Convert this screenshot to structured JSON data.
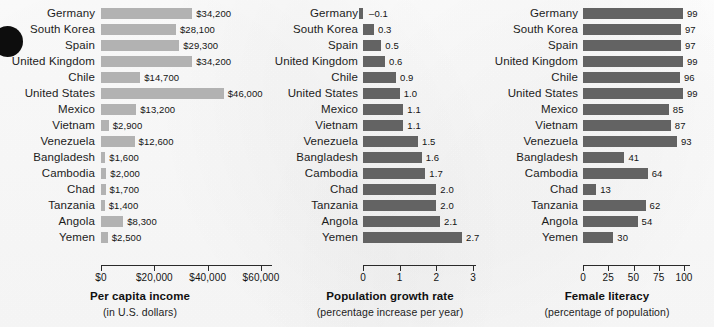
{
  "figure": {
    "categories": [
      "Germany",
      "South Korea",
      "Spain",
      "United Kingdom",
      "Chile",
      "United States",
      "Mexico",
      "Vietnam",
      "Venezuela",
      "Bangladesh",
      "Cambodia",
      "Chad",
      "Tanzania",
      "Angola",
      "Yemen"
    ],
    "bar_color_light": "#b2b2b2",
    "bar_color_dark": "#636363",
    "axis_color": "#2a2a2a"
  },
  "chart_data": [
    {
      "type": "bar",
      "orientation": "horizontal",
      "title": "Per capita income",
      "subtitle": "(in U.S. dollars)",
      "xlabel": "",
      "ylabel": "",
      "xlim": [
        0,
        60000
      ],
      "grid": false,
      "legend": "none",
      "bar_color": "#b2b2b2",
      "tick_values": [
        0,
        20000,
        40000,
        60000
      ],
      "tick_labels": [
        "$0",
        "$20,000",
        "$40,000",
        "$60,000"
      ],
      "categories": [
        "Germany",
        "South Korea",
        "Spain",
        "United Kingdom",
        "Chile",
        "United States",
        "Mexico",
        "Vietnam",
        "Venezuela",
        "Bangladesh",
        "Cambodia",
        "Chad",
        "Tanzania",
        "Angola",
        "Yemen"
      ],
      "values": [
        34200,
        28100,
        29300,
        34200,
        14700,
        46000,
        13200,
        2900,
        12600,
        1600,
        2000,
        1700,
        1400,
        8300,
        2500
      ],
      "value_labels": [
        "$34,200",
        "$28,100",
        "$29,300",
        "$34,200",
        "$14,700",
        "$46,000",
        "$13,200",
        "$2,900",
        "$12,600",
        "$1,600",
        "$2,000",
        "$1,700",
        "$1,400",
        "$8,300",
        "$2,500"
      ]
    },
    {
      "type": "bar",
      "orientation": "horizontal",
      "title": "Population growth rate",
      "subtitle": "(percentage increase per year)",
      "xlabel": "",
      "ylabel": "",
      "xlim": [
        0,
        3
      ],
      "grid": false,
      "legend": "none",
      "bar_color": "#636363",
      "tick_values": [
        0,
        1,
        2,
        3
      ],
      "tick_labels": [
        "0",
        "1",
        "2",
        "3"
      ],
      "categories": [
        "Germany",
        "South Korea",
        "Spain",
        "United Kingdom",
        "Chile",
        "United States",
        "Mexico",
        "Vietnam",
        "Venezuela",
        "Bangladesh",
        "Cambodia",
        "Chad",
        "Tanzania",
        "Angola",
        "Yemen"
      ],
      "values": [
        -0.1,
        0.3,
        0.5,
        0.6,
        0.9,
        1.0,
        1.1,
        1.1,
        1.5,
        1.6,
        1.7,
        2.0,
        2.0,
        2.1,
        2.7
      ],
      "value_labels": [
        "–0.1",
        "0.3",
        "0.5",
        "0.6",
        "0.9",
        "1.0",
        "1.1",
        "1.1",
        "1.5",
        "1.6",
        "1.7",
        "2.0",
        "2.0",
        "2.1",
        "2.7"
      ]
    },
    {
      "type": "bar",
      "orientation": "horizontal",
      "title": "Female literacy",
      "subtitle": "(percentage of population)",
      "xlabel": "",
      "ylabel": "",
      "xlim": [
        0,
        100
      ],
      "grid": false,
      "legend": "none",
      "bar_color": "#636363",
      "tick_values": [
        0,
        25,
        50,
        75,
        100
      ],
      "tick_labels": [
        "0",
        "25",
        "50",
        "75",
        "100"
      ],
      "categories": [
        "Germany",
        "South Korea",
        "Spain",
        "United Kingdom",
        "Chile",
        "United States",
        "Mexico",
        "Vietnam",
        "Venezuela",
        "Bangladesh",
        "Cambodia",
        "Chad",
        "Tanzania",
        "Angola",
        "Yemen"
      ],
      "values": [
        99,
        97,
        97,
        99,
        96,
        99,
        85,
        87,
        93,
        41,
        64,
        13,
        62,
        54,
        30
      ],
      "value_labels": [
        "99",
        "97",
        "97",
        "99",
        "96",
        "99",
        "85",
        "87",
        "93",
        "41",
        "64",
        "13",
        "62",
        "54",
        "30"
      ]
    }
  ]
}
